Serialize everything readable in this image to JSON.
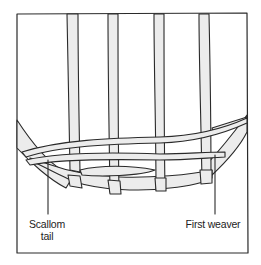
{
  "figure": {
    "colors": {
      "line": "#2a2a2a",
      "fill": "#ececec",
      "background": "#ffffff"
    },
    "labels": {
      "scallom_tail_line1": "Scallom",
      "scallom_tail_line2": "tail",
      "first_weaver": "First weaver"
    }
  }
}
